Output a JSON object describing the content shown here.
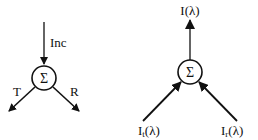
{
  "left_diagram": {
    "node_symbol": "Σ",
    "input_label": "Inc",
    "output_left_label": "T",
    "output_right_label": "R"
  },
  "right_diagram": {
    "node_symbol": "Σ",
    "output_label": "I(λ)",
    "input_left_label_main": "I",
    "input_left_label_sub": "t",
    "input_left_label_tail": "(λ)",
    "input_right_label_main": "I",
    "input_right_label_sub": "r",
    "input_right_label_tail": "(λ)"
  },
  "colors": {
    "stroke": "#111111",
    "background": "#ffffff"
  }
}
